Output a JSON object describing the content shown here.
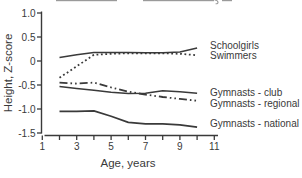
{
  "figure": {
    "background": "#ffffff",
    "line_color": "#3a3a3a",
    "clipped_title_visible": true
  },
  "chart_data": {
    "type": "line",
    "title": "",
    "xlabel": "Age, years",
    "ylabel": "Height, Z-score",
    "xlim": [
      1,
      11
    ],
    "ylim": [
      -1.5,
      1.0
    ],
    "grid": false,
    "legend_position": "right-of-lines",
    "x_tick_values_all": [
      1,
      2,
      3,
      4,
      5,
      6,
      7,
      8,
      9,
      10,
      11
    ],
    "x_tick_labels": [
      {
        "value": 1,
        "label": "1"
      },
      {
        "value": 3,
        "label": "3"
      },
      {
        "value": 5,
        "label": "5"
      },
      {
        "value": 7,
        "label": "7"
      },
      {
        "value": 9,
        "label": "9"
      },
      {
        "value": 11,
        "label": "11"
      }
    ],
    "y_ticks": [
      {
        "value": 1.0,
        "label": "1.0"
      },
      {
        "value": 0.5,
        "label": "0.5"
      },
      {
        "value": 0.0,
        "label": "0"
      },
      {
        "value": -0.5,
        "label": "-0.5"
      },
      {
        "value": -1.0,
        "label": "-1.0"
      },
      {
        "value": -1.5,
        "label": "-1.5"
      }
    ],
    "x": [
      2,
      3,
      4,
      5,
      6,
      7,
      8,
      9,
      10
    ],
    "series": [
      {
        "name": "Schoolgirls",
        "style": "solid",
        "stroke_width": 1.5,
        "values": [
          0.07,
          0.13,
          0.18,
          0.18,
          0.18,
          0.17,
          0.17,
          0.19,
          0.27
        ],
        "label_y": 49
      },
      {
        "name": "Swimmers",
        "style": "dotted",
        "stroke_width": 1.8,
        "values": [
          -0.35,
          -0.11,
          0.13,
          0.15,
          0.16,
          0.16,
          0.16,
          0.15,
          0.12
        ],
        "label_y": 58.5
      },
      {
        "name": "Gymnasts - club",
        "style": "solid",
        "stroke_width": 1.5,
        "values": [
          -0.53,
          -0.57,
          -0.61,
          -0.65,
          -0.68,
          -0.67,
          -0.62,
          -0.64,
          -0.67
        ],
        "label_y": 96
      },
      {
        "name": "Gymnasts - regional",
        "style": "dashdotdot",
        "stroke_width": 1.8,
        "values": [
          -0.45,
          -0.47,
          -0.45,
          -0.55,
          -0.64,
          -0.7,
          -0.75,
          -0.79,
          -0.83
        ],
        "label_y": 106.5
      },
      {
        "name": "Gymnasts - national",
        "style": "solid",
        "stroke_width": 1.7,
        "values": [
          -1.05,
          -1.05,
          -1.04,
          -1.15,
          -1.28,
          -1.31,
          -1.31,
          -1.33,
          -1.38
        ],
        "label_y": 126.5
      }
    ]
  }
}
